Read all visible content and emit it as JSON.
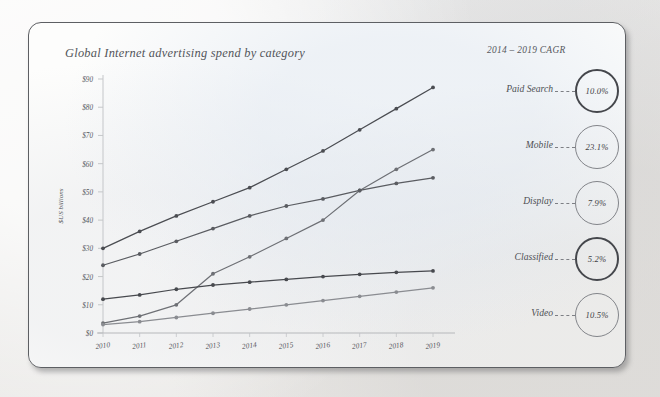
{
  "card": {
    "title": "Global Internet advertising spend by category",
    "cagr_heading": "2014 – 2019 CAGR"
  },
  "chart_data": {
    "type": "line",
    "title": "Global Internet advertising spend by category",
    "xlabel": "",
    "ylabel": "$US billions",
    "x": [
      "2010",
      "2011",
      "2012",
      "2013",
      "2014",
      "2015",
      "2016",
      "2017",
      "2018",
      "2019"
    ],
    "ylim": [
      0,
      90
    ],
    "yticks": [
      "$0",
      "$10",
      "$20",
      "$30",
      "$40",
      "$50",
      "$60",
      "$70",
      "$80",
      "$90"
    ],
    "ytick_values": [
      0,
      10,
      20,
      30,
      40,
      50,
      60,
      70,
      80,
      90
    ],
    "grid": false,
    "legend_position": "right",
    "markers": "circle",
    "series": [
      {
        "name": "Paid Search",
        "cagr": "10.0%",
        "color": "#4b4d52",
        "values": [
          30.0,
          36.0,
          41.5,
          46.5,
          51.5,
          58.0,
          64.5,
          72.0,
          79.5,
          87.0
        ]
      },
      {
        "name": "Mobile",
        "cagr": "23.1%",
        "color": "#6e7075",
        "values": [
          3.5,
          6.0,
          10.0,
          21.0,
          27.0,
          33.5,
          40.0,
          50.5,
          58.0,
          65.0
        ]
      },
      {
        "name": "Display",
        "cagr": "7.9%",
        "color": "#5a5c61",
        "values": [
          24.0,
          28.0,
          32.5,
          37.0,
          41.5,
          45.0,
          47.5,
          50.5,
          53.0,
          55.0
        ]
      },
      {
        "name": "Classified",
        "cagr": "5.2%",
        "color": "#47494e",
        "values": [
          12.0,
          13.5,
          15.5,
          17.0,
          18.0,
          19.0,
          20.0,
          20.8,
          21.5,
          22.0
        ]
      },
      {
        "name": "Video",
        "cagr": "10.5%",
        "color": "#8a8c91",
        "values": [
          3.0,
          4.0,
          5.5,
          7.0,
          8.5,
          10.0,
          11.5,
          13.0,
          14.5,
          16.0
        ]
      }
    ]
  },
  "legend": [
    {
      "label": "Paid Search",
      "cagr": "10.0%",
      "weight": "heavy"
    },
    {
      "label": "Mobile",
      "cagr": "23.1%",
      "weight": "light"
    },
    {
      "label": "Display",
      "cagr": "7.9%",
      "weight": "light"
    },
    {
      "label": "Classified",
      "cagr": "5.2%",
      "weight": "heavy"
    },
    {
      "label": "Video",
      "cagr": "10.5%",
      "weight": "light"
    }
  ]
}
